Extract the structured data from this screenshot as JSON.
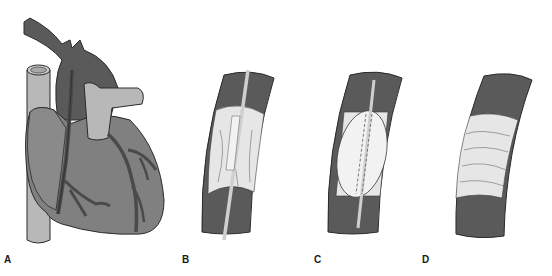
{
  "figure": {
    "panels": [
      {
        "id": "A",
        "label": "A",
        "depicts": "heart-with-coronary-arteries"
      },
      {
        "id": "B",
        "label": "B",
        "depicts": "catheter-in-stenosed-artery"
      },
      {
        "id": "C",
        "label": "C",
        "depicts": "balloon-inflated-in-artery"
      },
      {
        "id": "D",
        "label": "D",
        "depicts": "artery-after-angioplasty"
      }
    ],
    "colors": {
      "background": "#ffffff",
      "vessel_wall": "#5a5a5a",
      "heart_muscle": "#808080",
      "light_vessel": "#b8b8b8",
      "plaque": "#e6e6e6",
      "outline": "#2a2a2a"
    }
  }
}
